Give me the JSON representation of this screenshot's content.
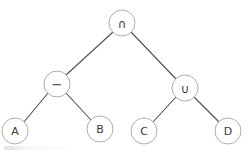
{
  "diagram": {
    "type": "binary-expression-tree",
    "background_color": "#ffffff",
    "node_fill_color": "#ffffff",
    "node_stroke_color": "#aeaeae",
    "edge_color": "#4f4f4f",
    "label_color": "#3a3a3a",
    "node_radius": 13,
    "nodes": [
      {
        "id": "root",
        "label": "∩",
        "icon": "intersection-symbol",
        "cx": 122,
        "cy": 23,
        "role": "operator",
        "class": "op-sym"
      },
      {
        "id": "minus",
        "label": "−",
        "icon": "minus-symbol",
        "cx": 57,
        "cy": 84,
        "role": "operator",
        "class": "minus-sym"
      },
      {
        "id": "union",
        "label": "∪",
        "icon": "union-symbol",
        "cx": 185,
        "cy": 88,
        "role": "operator",
        "class": "op-sym"
      },
      {
        "id": "leafA",
        "label": "A",
        "icon": "letter-a",
        "cx": 15,
        "cy": 131,
        "role": "operand",
        "class": ""
      },
      {
        "id": "leafB",
        "label": "B",
        "icon": "letter-b",
        "cx": 100,
        "cy": 129,
        "role": "operand",
        "class": ""
      },
      {
        "id": "leafC",
        "label": "C",
        "icon": "letter-c",
        "cx": 144,
        "cy": 131,
        "role": "operand",
        "class": ""
      },
      {
        "id": "leafD",
        "label": "D",
        "icon": "letter-d",
        "cx": 228,
        "cy": 131,
        "role": "operand",
        "class": ""
      }
    ],
    "edges": [
      {
        "from": "root",
        "to": "minus",
        "x1": 113,
        "y1": 32,
        "x2": 66,
        "y2": 75
      },
      {
        "from": "root",
        "to": "union",
        "x1": 131,
        "y1": 32,
        "x2": 176,
        "y2": 79
      },
      {
        "from": "minus",
        "to": "leafA",
        "x1": 48,
        "y1": 93,
        "x2": 24,
        "y2": 122
      },
      {
        "from": "minus",
        "to": "leafB",
        "x1": 66,
        "y1": 93,
        "x2": 91,
        "y2": 120
      },
      {
        "from": "union",
        "to": "leafC",
        "x1": 176,
        "y1": 97,
        "x2": 153,
        "y2": 122
      },
      {
        "from": "union",
        "to": "leafD",
        "x1": 194,
        "y1": 97,
        "x2": 219,
        "y2": 122
      }
    ]
  }
}
